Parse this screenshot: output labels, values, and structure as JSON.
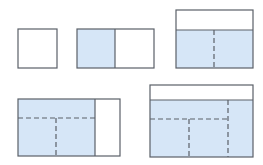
{
  "colors": {
    "fill": "#d6e6f7",
    "stroke": "#5a6068",
    "background": "#ffffff"
  },
  "diagram": {
    "steps": [
      {
        "id": 1,
        "label": "single square",
        "rect": [
          18,
          29,
          39,
          39
        ]
      },
      {
        "id": 2,
        "label": "two squares",
        "rect": [
          77,
          29,
          77,
          39
        ],
        "shaded": [
          77,
          29,
          38,
          39
        ],
        "solid": [
          [
            115,
            29,
            115,
            68
          ]
        ]
      },
      {
        "id": 3,
        "label": "added top band",
        "rect": [
          176,
          10,
          77,
          58
        ],
        "shaded": [
          176,
          30,
          77,
          38
        ],
        "solid": [
          [
            176,
            30,
            253,
            30
          ]
        ],
        "dashed": [
          [
            214,
            30,
            214,
            68
          ]
        ]
      },
      {
        "id": 4,
        "label": "added right column",
        "rect": [
          18,
          99,
          102,
          57
        ],
        "shaded": [
          18,
          99,
          77,
          57
        ],
        "solid": [
          [
            95,
            99,
            95,
            156
          ]
        ],
        "dashed": [
          [
            18,
            118,
            95,
            118
          ],
          [
            56,
            118,
            56,
            156
          ]
        ]
      },
      {
        "id": 5,
        "label": "added top band again",
        "rect": [
          150,
          85,
          103,
          72
        ],
        "shaded": [
          150,
          100,
          103,
          57
        ],
        "solid": [
          [
            150,
            100,
            253,
            100
          ]
        ],
        "dashed": [
          [
            228,
            100,
            228,
            157
          ],
          [
            150,
            119,
            228,
            119
          ],
          [
            189,
            119,
            189,
            157
          ]
        ]
      }
    ]
  }
}
